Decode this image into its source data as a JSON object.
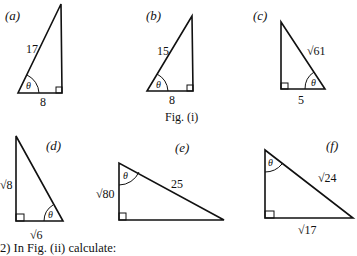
{
  "figure": {
    "caption": "Fig. (i)",
    "angle_symbol": "θ",
    "triangles": [
      {
        "id": "a",
        "label": "(a)",
        "hypotenuse": "17",
        "base": "8",
        "vertical": ""
      },
      {
        "id": "b",
        "label": "(b)",
        "hypotenuse": "15",
        "base": "8",
        "vertical": ""
      },
      {
        "id": "c",
        "label": "(c)",
        "hypotenuse": "√61",
        "base": "5",
        "vertical": ""
      },
      {
        "id": "d",
        "label": "(d)",
        "hypotenuse": "",
        "base": "√6",
        "vertical": "√8"
      },
      {
        "id": "e",
        "label": "(e)",
        "hypotenuse": "25",
        "base": "",
        "vertical": "√80"
      },
      {
        "id": "f",
        "label": "(f)",
        "hypotenuse": "√24",
        "base": "√17",
        "vertical": ""
      }
    ]
  },
  "question": {
    "text": "2)  In Fig. (ii) calculate:"
  }
}
